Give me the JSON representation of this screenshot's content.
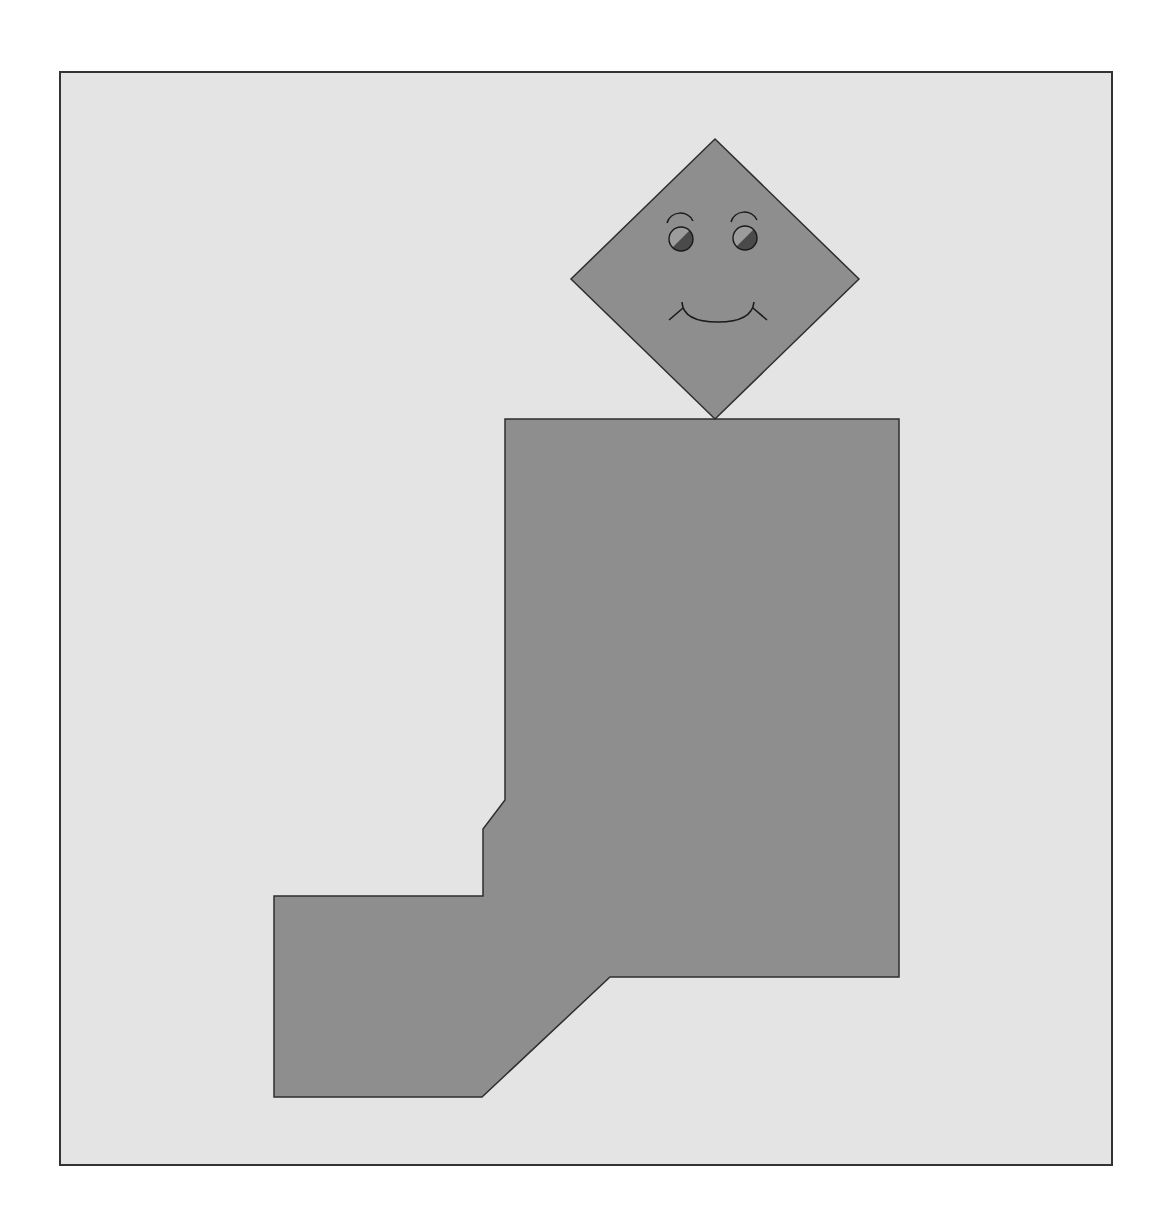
{
  "figure": {
    "colors": {
      "page_background": "#ffffff",
      "frame_fill": "#e4e4e4",
      "frame_stroke": "#333333",
      "shape_fill": "#8e8e8e",
      "shape_stroke": "#2e2e2e",
      "eye_light": "#9c9c9c",
      "eye_dark": "#4a4a4a",
      "face_line": "#1a1a1a"
    },
    "frame": {
      "x": 60,
      "y": 72,
      "width": 1052,
      "height": 1093
    },
    "head": {
      "shape": "diamond",
      "points": "715,139 859,279 715,419 571,279"
    },
    "body": {
      "shape": "polygon",
      "points": "505,419 899,419 899,977 610,977 482,1097 274,1097 274,896 483,896 483,829 505,800"
    },
    "face": {
      "left_eye": {
        "cx": 681,
        "cy": 239,
        "r": 12
      },
      "right_eye": {
        "cx": 745,
        "cy": 238,
        "r": 12
      },
      "left_brow": "M 667 223 A 14 14 0 0 1 693 221",
      "right_brow": "M 731 222 A 14 14 0 0 1 757 220",
      "smile": "M 682 302 Q 683 322 718 322 Q 752 322 754 302",
      "left_cheek": "M 669 320 L 683 308",
      "right_cheek": "M 753 308 L 767 320"
    }
  }
}
